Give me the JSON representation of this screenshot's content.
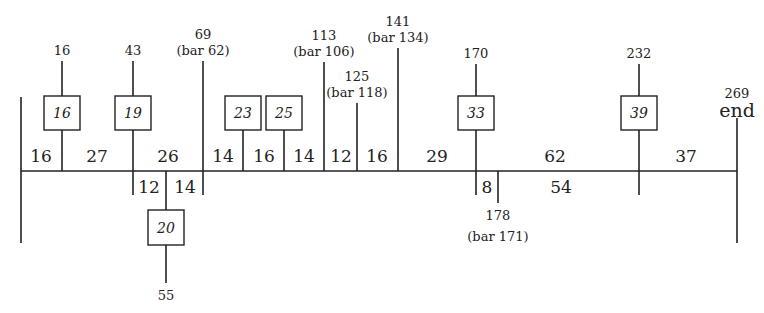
{
  "diagram": {
    "type": "bar-structure tree (timeline of bar numbers)",
    "main_line_y": 171,
    "start_x": 21,
    "end_x": 737,
    "start_line": {
      "x": 21,
      "y1": 97,
      "y2": 243
    },
    "end_marker": {
      "x": 737,
      "y1": 118,
      "y2": 243,
      "number": "269",
      "label": "end"
    },
    "upper_branches": [
      {
        "x": 62,
        "top_label": "16",
        "sub_label": "",
        "box": "16",
        "line_top": 61
      },
      {
        "x": 133,
        "top_label": "43",
        "sub_label": "",
        "box": "19",
        "line_top": 61,
        "extends_below": true
      },
      {
        "x": 203,
        "top_label": "69",
        "sub_label": "(bar 62)",
        "box": "",
        "line_top": 61,
        "extends_below": true
      },
      {
        "x": 243,
        "top_label": "",
        "sub_label": "",
        "box": "23",
        "line_top": 130
      },
      {
        "x": 284,
        "top_label": "",
        "sub_label": "",
        "box": "25",
        "line_top": 130
      },
      {
        "x": 324,
        "top_label": "113",
        "sub_label": "(bar 106)",
        "box": "",
        "line_top": 62
      },
      {
        "x": 357,
        "top_label": "125",
        "sub_label": "(bar 118)",
        "box": "",
        "line_top": 103
      },
      {
        "x": 398,
        "top_label": "141",
        "sub_label": "(bar 134)",
        "box": "",
        "line_top": 48
      },
      {
        "x": 476,
        "top_label": "170",
        "sub_label": "",
        "box": "33",
        "line_top": 64,
        "extends_below": true
      },
      {
        "x": 639,
        "top_label": "232",
        "sub_label": "",
        "box": "39",
        "line_top": 64,
        "extends_below": true
      }
    ],
    "upper_segments": [
      {
        "x": 41,
        "value": "16"
      },
      {
        "x": 97,
        "value": "27"
      },
      {
        "x": 168,
        "value": "26"
      },
      {
        "x": 223,
        "value": "14"
      },
      {
        "x": 264,
        "value": "16"
      },
      {
        "x": 304,
        "value": "14"
      },
      {
        "x": 341,
        "value": "12"
      },
      {
        "x": 377,
        "value": "16"
      },
      {
        "x": 437,
        "value": "29"
      },
      {
        "x": 555,
        "value": "62"
      },
      {
        "x": 686,
        "value": "37"
      }
    ],
    "lower_branch": {
      "x": 166,
      "box": "20",
      "bottom_label": "55",
      "segments": [
        {
          "x": 149,
          "value": "12"
        },
        {
          "x": 185,
          "value": "14"
        }
      ]
    },
    "lower_marker": {
      "x": 498,
      "label": "178",
      "sub_label": "(bar 171)"
    },
    "lower_segments": [
      {
        "x": 487,
        "value": "8"
      },
      {
        "x": 561,
        "value": "54"
      }
    ]
  }
}
